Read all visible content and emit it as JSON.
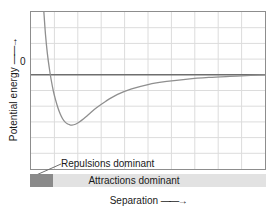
{
  "chart_data": {
    "type": "line",
    "title": "",
    "subtitle": "",
    "xlabel": "Separation",
    "ylabel": "Potential energy",
    "xlabel_arrow": "——→",
    "ylabel_arrow": "——→",
    "y_tick_labels": [
      "0"
    ],
    "y_tick_values": [
      0
    ],
    "x_tick_labels": [],
    "xlim": [
      0,
      10
    ],
    "ylim": [
      -6,
      4
    ],
    "grid": true,
    "grid_columns": 10,
    "grid_rows": 10,
    "legend": null,
    "zero_line": true,
    "series": [
      {
        "name": "Intermolecular potential energy",
        "x": [
          0.55,
          0.62,
          0.7,
          0.78,
          0.86,
          0.95,
          1.05,
          1.15,
          1.25,
          1.35,
          1.45,
          1.55,
          1.65,
          1.75,
          1.9,
          2.05,
          2.25,
          2.5,
          2.8,
          3.2,
          3.7,
          4.3,
          5.0,
          5.8,
          6.7,
          7.6,
          8.5,
          9.4,
          10.0
        ],
        "y": [
          4.0,
          2.55,
          1.35,
          0.45,
          -0.3,
          -1.0,
          -1.6,
          -2.1,
          -2.5,
          -2.8,
          -3.0,
          -3.12,
          -3.18,
          -3.2,
          -3.15,
          -3.02,
          -2.8,
          -2.48,
          -2.1,
          -1.68,
          -1.25,
          -0.9,
          -0.62,
          -0.42,
          -0.27,
          -0.17,
          -0.1,
          -0.04,
          -0.01
        ]
      }
    ],
    "annotations": [
      {
        "name": "repulsions-dominant",
        "text": "Repulsions dominant"
      },
      {
        "name": "attractions-dominant",
        "text": "Attractions dominant"
      }
    ],
    "colors": {
      "curve": "#8f8f8f",
      "grid": "#d9d9d9",
      "frame": "#8d8d8d",
      "zero_line": "#6e6e6e",
      "repulsion_bar": "#8a8a8a",
      "attraction_bar": "#e2e2e2",
      "text": "#1a1a1a",
      "background": "#ffffff"
    }
  },
  "axes": {
    "y_label": "Potential energy",
    "y_arrow": "——→",
    "y_zero_tick": "0",
    "x_label": "Separation",
    "x_arrow": "——→"
  },
  "bar": {
    "repulsions_label": "Repulsions dominant",
    "attractions_label": "Attractions dominant"
  }
}
